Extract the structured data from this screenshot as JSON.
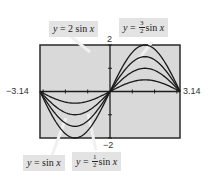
{
  "chart_data": {
    "type": "line",
    "title": "",
    "xlabel": "",
    "ylabel": "",
    "xlim": [
      -3.14,
      3.14
    ],
    "ylim": [
      -2,
      2
    ],
    "grid": false,
    "background": "#d9d9d9",
    "tick_labels": {
      "x_min": "−3.14",
      "x_max": "3.14",
      "y_max": "2",
      "y_min": "−2"
    },
    "series": [
      {
        "name": "y = sin x",
        "amplitude": 1
      },
      {
        "name": "y = 1/2 sin x",
        "amplitude": 0.5
      },
      {
        "name": "y = 3/2 sin x",
        "amplitude": 1.5
      },
      {
        "name": "y = 2 sin x",
        "amplitude": 2
      }
    ],
    "annotations": [
      {
        "text": "y = 2 sin x",
        "position": "top-left"
      },
      {
        "text": "y = 3/2 sin x",
        "position": "top-right"
      },
      {
        "text": "y = sin x",
        "position": "bottom-left"
      },
      {
        "text": "y = 1/2 sin x",
        "position": "bottom-center"
      }
    ]
  },
  "labels": {
    "two_sin": {
      "y": "y",
      "eq": " = 2 sin ",
      "x": "x"
    },
    "three_half_sin": {
      "y": "y",
      "eq": " = ",
      "num": "3",
      "den": "2",
      "sin": "sin ",
      "x": "x"
    },
    "sin": {
      "y": "y",
      "eq": " = sin ",
      "x": "x"
    },
    "half_sin": {
      "y": "y",
      "eq": " = ",
      "num": "1",
      "den": "2",
      "sin": "sin ",
      "x": "x"
    }
  },
  "ticks": {
    "x_min": "−3.14",
    "x_max": "3.14",
    "y_max": "2",
    "y_min": "−2"
  }
}
